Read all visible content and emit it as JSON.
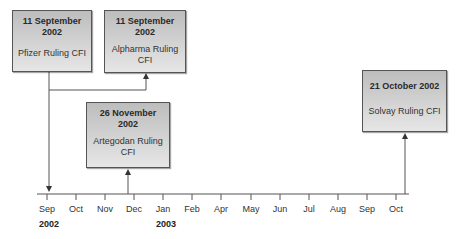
{
  "events": [
    {
      "date": "11 September 2002",
      "date_line1": "11 September",
      "date_line2": "2002",
      "label": "Pfizer Ruling CFI"
    },
    {
      "date": "11 September 2002",
      "date_line1": "11 September",
      "date_line2": "2002",
      "label": "Alpharma Ruling CFI"
    },
    {
      "date": "26 November 2002",
      "date_line1": "26 November",
      "date_line2": "2002",
      "label": "Artegodan Ruling CFI"
    },
    {
      "date": "21 October 2002",
      "date_line1": "21 October 2002",
      "date_line2": "",
      "label": "Solvay Ruling CFI"
    }
  ],
  "axis": {
    "ticks": [
      "Sep",
      "Oct",
      "Nov",
      "Dec",
      "Jan",
      "Feb",
      "Apr",
      "May",
      "Jun",
      "Jul",
      "Aug",
      "Sep",
      "Oct"
    ],
    "years": [
      "2002",
      "2003"
    ]
  },
  "colors": {
    "box_top": "#bdbdbd",
    "box_bottom": "#e6e6e6",
    "line": "#555555"
  }
}
